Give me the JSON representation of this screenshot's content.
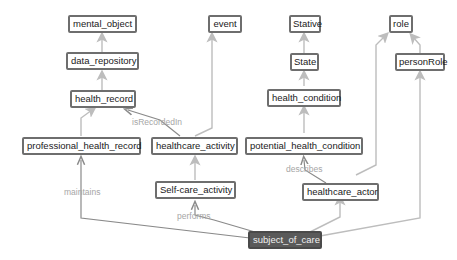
{
  "diagram": {
    "colors": {
      "edge": "#bdbdbd",
      "node_border": "#6e6e6e",
      "selected_fill": "#5a5a5a",
      "edge_label": "#a6a6a6"
    },
    "nodes": {
      "mental_object": "mental_object",
      "data_repository": "data_repository",
      "health_record": "health_record",
      "professional_health_record": "professional_health_record",
      "event": "event",
      "healthcare_activity": "healthcare_activity",
      "self_care_activity": "Self-care_activity",
      "stative": "Stative",
      "state": "State",
      "health_condition": "health_condition",
      "potential_health_condition": "potential_health_condition",
      "role": "role",
      "person_role": "personRole",
      "healthcare_actor": "healthcare_actor",
      "subject_of_care": "subject_of_care"
    },
    "edge_labels": {
      "is_recorded_in": "isRecordedIn",
      "maintains": "maintains",
      "performs": "performs",
      "describes": "describes"
    },
    "selected_node": "subject_of_care"
  }
}
